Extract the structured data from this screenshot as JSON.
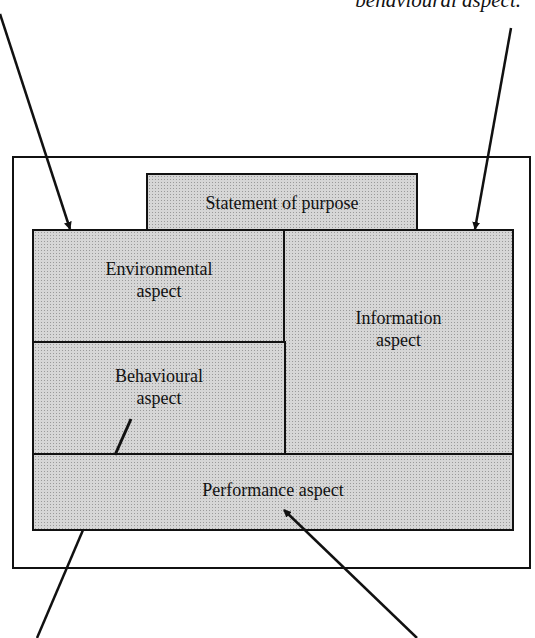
{
  "caption": "behavioural aspect.",
  "boxes": {
    "statement": {
      "label": "Statement of purpose"
    },
    "environmental": {
      "line1": "Environmental",
      "line2": "aspect"
    },
    "information": {
      "line1": "Information",
      "line2": "aspect"
    },
    "behavioural": {
      "line1": "Behavioural",
      "line2": "aspect"
    },
    "performance": {
      "label": "Performance aspect"
    }
  },
  "colors": {
    "box_fill": "#d6d6d6",
    "stroke": "#111111"
  }
}
